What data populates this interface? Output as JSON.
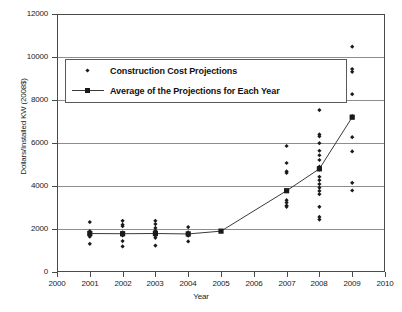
{
  "chart_data": {
    "type": "scatter",
    "title": "",
    "xlabel": "Year",
    "ylabel": "Dollars/Installed KW (2008$)",
    "xlim": [
      2000,
      2010
    ],
    "ylim": [
      0,
      12000
    ],
    "grid": true,
    "xticks": [
      "2000",
      "2001",
      "2002",
      "2003",
      "2004",
      "2005",
      "2006",
      "2007",
      "2008",
      "2009",
      "2010"
    ],
    "yticks": [
      "0",
      "2000",
      "4000",
      "6000",
      "8000",
      "10000",
      "12000"
    ],
    "gridlines": [
      2000,
      4000,
      6000,
      8000,
      10000
    ],
    "legend_position": "upper-left-inside",
    "series": [
      {
        "name": "Construction Cost Projections",
        "marker": "diamond",
        "type": "scatter",
        "points": [
          {
            "x": 2001,
            "y": 2320
          },
          {
            "x": 2001,
            "y": 1900
          },
          {
            "x": 2001,
            "y": 1820
          },
          {
            "x": 2001,
            "y": 1760
          },
          {
            "x": 2001,
            "y": 1700
          },
          {
            "x": 2001,
            "y": 1640
          },
          {
            "x": 2001,
            "y": 1310
          },
          {
            "x": 2002,
            "y": 2380
          },
          {
            "x": 2002,
            "y": 2200
          },
          {
            "x": 2002,
            "y": 2130
          },
          {
            "x": 2002,
            "y": 1840
          },
          {
            "x": 2002,
            "y": 1780
          },
          {
            "x": 2002,
            "y": 1700
          },
          {
            "x": 2002,
            "y": 1440
          },
          {
            "x": 2002,
            "y": 1190
          },
          {
            "x": 2003,
            "y": 2380
          },
          {
            "x": 2003,
            "y": 2230
          },
          {
            "x": 2003,
            "y": 2050
          },
          {
            "x": 2003,
            "y": 1920
          },
          {
            "x": 2003,
            "y": 1830
          },
          {
            "x": 2003,
            "y": 1760
          },
          {
            "x": 2003,
            "y": 1690
          },
          {
            "x": 2003,
            "y": 1590
          },
          {
            "x": 2003,
            "y": 1230
          },
          {
            "x": 2004,
            "y": 2090
          },
          {
            "x": 2004,
            "y": 1840
          },
          {
            "x": 2004,
            "y": 1760
          },
          {
            "x": 2004,
            "y": 1690
          },
          {
            "x": 2004,
            "y": 1420
          },
          {
            "x": 2005,
            "y": 1900
          },
          {
            "x": 2007,
            "y": 5860
          },
          {
            "x": 2007,
            "y": 5070
          },
          {
            "x": 2007,
            "y": 4680
          },
          {
            "x": 2007,
            "y": 4610
          },
          {
            "x": 2007,
            "y": 3780
          },
          {
            "x": 2007,
            "y": 3340
          },
          {
            "x": 2007,
            "y": 3230
          },
          {
            "x": 2007,
            "y": 3090
          },
          {
            "x": 2007,
            "y": 3030
          },
          {
            "x": 2008,
            "y": 9320
          },
          {
            "x": 2008,
            "y": 7530
          },
          {
            "x": 2008,
            "y": 6400
          },
          {
            "x": 2008,
            "y": 6310
          },
          {
            "x": 2008,
            "y": 5990
          },
          {
            "x": 2008,
            "y": 5640
          },
          {
            "x": 2008,
            "y": 5430
          },
          {
            "x": 2008,
            "y": 5210
          },
          {
            "x": 2008,
            "y": 4900
          },
          {
            "x": 2008,
            "y": 4760
          },
          {
            "x": 2008,
            "y": 4430
          },
          {
            "x": 2008,
            "y": 4270
          },
          {
            "x": 2008,
            "y": 4090
          },
          {
            "x": 2008,
            "y": 3920
          },
          {
            "x": 2008,
            "y": 3770
          },
          {
            "x": 2008,
            "y": 3620
          },
          {
            "x": 2008,
            "y": 3030
          },
          {
            "x": 2008,
            "y": 2560
          },
          {
            "x": 2008,
            "y": 2440
          },
          {
            "x": 2009,
            "y": 10480
          },
          {
            "x": 2009,
            "y": 9440
          },
          {
            "x": 2009,
            "y": 9310
          },
          {
            "x": 2009,
            "y": 8270
          },
          {
            "x": 2009,
            "y": 7250
          },
          {
            "x": 2009,
            "y": 6270
          },
          {
            "x": 2009,
            "y": 5610
          },
          {
            "x": 2009,
            "y": 4150
          },
          {
            "x": 2009,
            "y": 3790
          }
        ]
      },
      {
        "name": "Average of the Projections for Each Year",
        "marker": "square",
        "type": "line",
        "x": [
          2001,
          2002,
          2003,
          2004,
          2005,
          2007,
          2008,
          2009
        ],
        "values": [
          1790,
          1780,
          1790,
          1770,
          1900,
          3780,
          4800,
          7200
        ]
      }
    ]
  },
  "legend": {
    "items": [
      {
        "label": "Construction Cost Projections",
        "marker": "diamond"
      },
      {
        "label": "Average of the Projections for Each Year",
        "marker": "line-square"
      }
    ]
  }
}
